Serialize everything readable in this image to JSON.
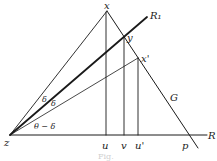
{
  "diagram": {
    "points": {
      "z": {
        "label": "z",
        "x": 10,
        "y": 135
      },
      "x": {
        "label": "x",
        "x": 107,
        "y": 11
      },
      "y": {
        "label": "y",
        "x": 124,
        "y": 37
      },
      "x_prime": {
        "label": "x'",
        "x": 138,
        "y": 58
      },
      "u": {
        "label": "u",
        "x": 105,
        "y": 135
      },
      "v": {
        "label": "v",
        "x": 124,
        "y": 135
      },
      "u_prime": {
        "label": "u'",
        "x": 138,
        "y": 135
      },
      "p": {
        "label": "p",
        "x": 190,
        "y": 135
      }
    },
    "lines": {
      "R": {
        "label": "R"
      },
      "R1": {
        "label": "R₁"
      },
      "G": {
        "label": "G"
      }
    },
    "angles": {
      "delta_upper": "δ",
      "delta_lower": "δ",
      "theta_minus_delta": "θ − δ"
    },
    "caption": "Fig."
  }
}
